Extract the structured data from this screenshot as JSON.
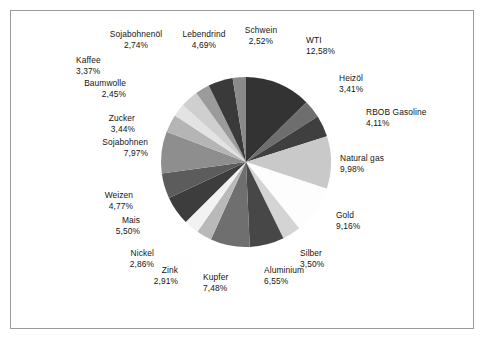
{
  "chart_data": {
    "type": "pie",
    "title": "",
    "subtitle": "",
    "xlabel": "",
    "ylabel": "",
    "legend_position": "none",
    "grid": false,
    "label_format": "name + percent (German decimal comma)",
    "start_angle_deg": 0,
    "direction": "clockwise",
    "categories": [
      "WTI",
      "Heizöl",
      "RBOB Gasoline",
      "Natural gas",
      "Gold",
      "Silber",
      "Aluminium",
      "Kupfer",
      "Zink",
      "Nickel",
      "Mais",
      "Weizen",
      "Sojabohnen",
      "Zucker",
      "Baumwolle",
      "Kaffee",
      "Sojabohnenöl",
      "Lebendrind",
      "Schwein"
    ],
    "values": [
      12.58,
      3.41,
      4.11,
      9.98,
      9.16,
      3.5,
      6.55,
      7.48,
      2.91,
      2.86,
      5.5,
      4.77,
      7.97,
      3.44,
      2.45,
      3.37,
      2.74,
      4.69,
      2.52
    ],
    "value_labels": [
      "12,58%",
      "3,41%",
      "4,11%",
      "9,98%",
      "9,16%",
      "3,50%",
      "6,55%",
      "7,48%",
      "2,91%",
      "2,86%",
      "5,50%",
      "4,77%",
      "7,97%",
      "3,44%",
      "2,45%",
      "3,37%",
      "2,74%",
      "4,69%",
      "2,52%"
    ],
    "colors": [
      "#333333",
      "#6e6e6e",
      "#3f3f3f",
      "#c9c9c9",
      "#fdfdfd",
      "#d4d4d4",
      "#474747",
      "#6f6f6f",
      "#b9b9b9",
      "#f2f2f2",
      "#3d3d3d",
      "#5c5c5c",
      "#8e8e8e",
      "#b5b5b5",
      "#e3e3e3",
      "#cfcfcf",
      "#9b9b9b",
      "#3a3a3a",
      "#8a8a8a"
    ]
  },
  "labels": [
    {
      "name": "WTI",
      "value": "12,58%",
      "x": 306,
      "y": 35,
      "align": "left"
    },
    {
      "name": "Heizöl",
      "value": "3,41%",
      "x": 339,
      "y": 73,
      "align": "left"
    },
    {
      "name": "RBOB Gasoline",
      "value": "4,11%",
      "x": 366,
      "y": 107,
      "align": "left"
    },
    {
      "name": "Natural gas",
      "value": "9,98%",
      "x": 340,
      "y": 153,
      "align": "left"
    },
    {
      "name": "Gold",
      "value": "9,16%",
      "x": 336,
      "y": 210,
      "align": "left"
    },
    {
      "name": "Silber",
      "value": "3,50%",
      "x": 300,
      "y": 248,
      "align": "left"
    },
    {
      "name": "Aluminium",
      "value": "6,55%",
      "x": 264,
      "y": 265,
      "align": "left"
    },
    {
      "name": "Kupfer",
      "value": "7,48%",
      "x": 203,
      "y": 272,
      "align": "left"
    },
    {
      "name": "Zink",
      "value": "2,91%",
      "x": 178,
      "y": 265,
      "align": "right"
    },
    {
      "name": "Nickel",
      "value": "2,86%",
      "x": 154,
      "y": 248,
      "align": "right"
    },
    {
      "name": "Mais",
      "value": "5,50%",
      "x": 140,
      "y": 215,
      "align": "right"
    },
    {
      "name": "Weizen",
      "value": "4,77%",
      "x": 133,
      "y": 190,
      "align": "right"
    },
    {
      "name": "Sojabohnen",
      "value": "7,97%",
      "x": 148,
      "y": 137,
      "align": "right"
    },
    {
      "name": "Zucker",
      "value": "3,44%",
      "x": 135,
      "y": 113,
      "align": "right"
    },
    {
      "name": "Baumwolle",
      "value": "2,45%",
      "x": 126,
      "y": 78,
      "align": "right"
    },
    {
      "name": "Kaffee",
      "value": "3,37%",
      "x": 76,
      "y": 55,
      "align": "left"
    },
    {
      "name": "Sojabohnenöl",
      "value": "2,74%",
      "x": 136,
      "y": 29,
      "align": "center"
    },
    {
      "name": "Lebendrind",
      "value": "4,69%",
      "x": 204,
      "y": 29,
      "align": "center"
    },
    {
      "name": "Schwein",
      "value": "2,52%",
      "x": 261,
      "y": 25,
      "align": "center"
    }
  ],
  "geometry": {
    "center_x": 246,
    "center_y": 162,
    "radius": 85
  }
}
